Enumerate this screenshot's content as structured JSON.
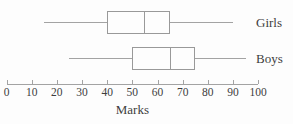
{
  "figure": {
    "axis_label": "Marks"
  },
  "chart_data": {
    "type": "boxplot",
    "orientation": "horizontal",
    "title": "",
    "xlabel": "Marks",
    "ylabel": "",
    "xlim": [
      0,
      100
    ],
    "x_ticks": [
      0,
      10,
      20,
      30,
      40,
      50,
      60,
      70,
      80,
      90,
      100
    ],
    "grid": false,
    "legend_position": "right-of-each-plot",
    "series": [
      {
        "name": "Girls",
        "min": 15,
        "q1": 40,
        "median": 55,
        "q3": 65,
        "max": 90
      },
      {
        "name": "Boys",
        "min": 25,
        "q1": 50,
        "median": 65,
        "q3": 75,
        "max": 95
      }
    ],
    "colors": {
      "line": "#a3a3a3",
      "box_border": "#999999",
      "text": "#3d3d3d",
      "background": "#fdfdfd"
    }
  }
}
